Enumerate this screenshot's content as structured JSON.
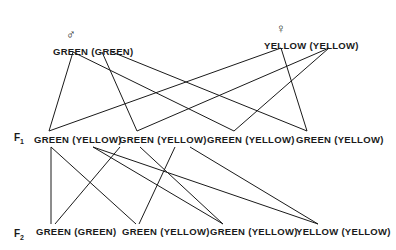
{
  "parents": {
    "male": {
      "symbol": "♂",
      "phenotype": "GREEN",
      "genotype": "(GREEN)"
    },
    "female": {
      "symbol": "♀",
      "phenotype": "YELLOW",
      "genotype": "(YELLOW)"
    }
  },
  "f1": {
    "label": "F",
    "label_sub": "1",
    "offspring": [
      {
        "phenotype": "GREEN",
        "genotype": "(YELLOW)"
      },
      {
        "phenotype": "GREEN",
        "genotype": "(YELLOW)"
      },
      {
        "phenotype": "GREEN",
        "genotype": "(YELLOW)"
      },
      {
        "phenotype": "GREEN",
        "genotype": "(YELLOW)"
      }
    ]
  },
  "f2": {
    "label": "F",
    "label_sub": "2",
    "offspring": [
      {
        "phenotype": "GREEN",
        "genotype": "(GREEN)"
      },
      {
        "phenotype": "GREEN",
        "genotype": "(YELLOW)"
      },
      {
        "phenotype": "GREEN",
        "genotype": "(YELLOW)"
      },
      {
        "phenotype": "YELLOW",
        "genotype": "(YELLOW)"
      }
    ]
  },
  "line_color": "#1a1a1a"
}
